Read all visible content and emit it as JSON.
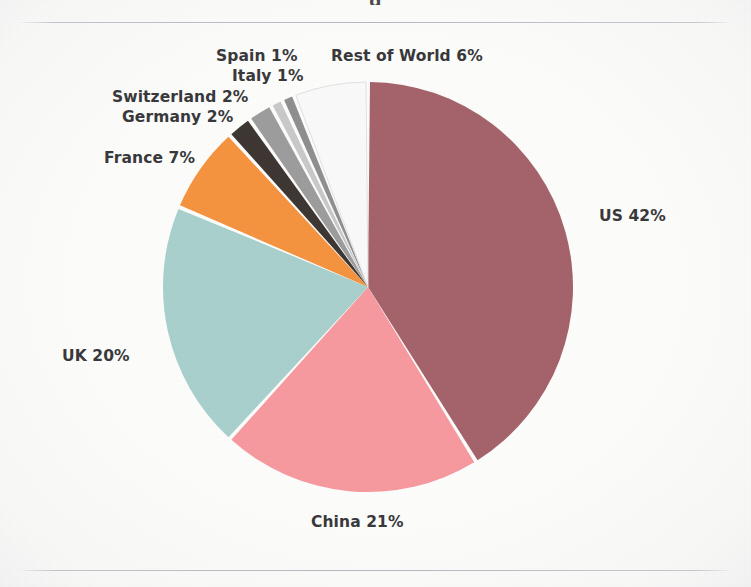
{
  "page": {
    "title_remnant": "g",
    "background_color": "#fdfdfc",
    "rule_color": "#96969f"
  },
  "chart_data": {
    "type": "pie",
    "title": "",
    "subtitle": "",
    "xlabel": "",
    "ylabel": "",
    "legend_position": "none",
    "label_format": "{name} {value}%",
    "start_angle_deg": 0,
    "direction": "clockwise",
    "units": "percent",
    "total": 100,
    "categories": [
      "US",
      "China",
      "UK",
      "France",
      "Germany",
      "Switzerland",
      "Italy",
      "Spain",
      "Rest of World"
    ],
    "values": [
      42,
      21,
      20,
      7,
      2,
      2,
      1,
      1,
      6
    ],
    "colors": [
      "#a5636a",
      "#f79aa0",
      "#a9d0cd",
      "#f5933f",
      "#3e3632",
      "#9d9d9d",
      "#c9c9c9",
      "#8f8f8f",
      "#fafafa"
    ],
    "slices": [
      {
        "name": "US",
        "value": 42,
        "label": "US 42%",
        "color": "#a5636a"
      },
      {
        "name": "China",
        "value": 21,
        "label": "China 21%",
        "color": "#f79aa0"
      },
      {
        "name": "UK",
        "value": 20,
        "label": "UK 20%",
        "color": "#a9d0cd"
      },
      {
        "name": "France",
        "value": 7,
        "label": "France 7%",
        "color": "#f5933f"
      },
      {
        "name": "Germany",
        "value": 2,
        "label": "Germany 2%",
        "color": "#3e3632"
      },
      {
        "name": "Switzerland",
        "value": 2,
        "label": "Switzerland 2%",
        "color": "#9d9d9d"
      },
      {
        "name": "Italy",
        "value": 1,
        "label": "Italy 1%",
        "color": "#c9c9c9"
      },
      {
        "name": "Spain",
        "value": 1,
        "label": "Spain 1%",
        "color": "#8f8f8f"
      },
      {
        "name": "Rest of World",
        "value": 6,
        "label": "Rest of World 6%",
        "color": "#fafafa"
      }
    ],
    "geometry": {
      "center_x": 368,
      "center_y": 287,
      "radius": 205,
      "gap_deg": 1.1
    }
  },
  "labels": {
    "us": "US 42%",
    "china": "China 21%",
    "uk": "UK 20%",
    "france": "France 7%",
    "germany": "Germany 2%",
    "switzerland": "Switzerland 2%",
    "italy": "Italy 1%",
    "spain": "Spain 1%",
    "rest_of_world": "Rest of World 6%"
  }
}
